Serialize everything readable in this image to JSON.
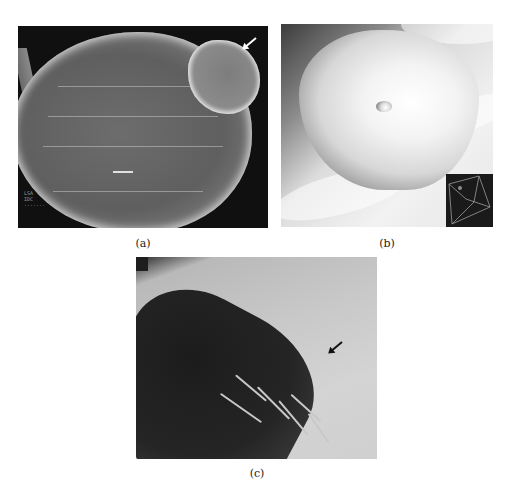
{
  "figure": {
    "panels": [
      {
        "id": "a",
        "label": "(a)",
        "description": "3D CT volume rendering with dark background; white arrow points to upper-right lobe",
        "arrow_color": "#ffffff",
        "overlay_text": "LSA\nIDC\n·······"
      },
      {
        "id": "b",
        "label": "(b)",
        "description": "Shaded 3D virtual endoscopic surface view with small central orifice and orientation cube inset (lower right)"
      },
      {
        "id": "c",
        "label": "(c)",
        "description": "Grayscale contrast radiograph with dark trabeculated cavity; black arrow points to smooth contour",
        "arrow_color": "#111111"
      }
    ]
  }
}
